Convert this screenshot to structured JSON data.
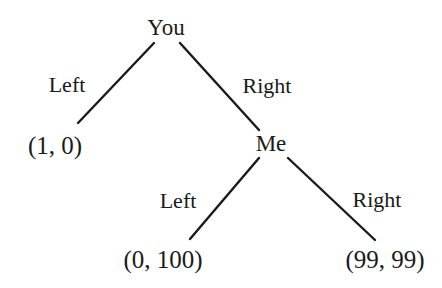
{
  "figure": {
    "type": "game-tree",
    "background_color": "#ffffff",
    "line_color": "#1a1a1a",
    "text_color": "#1a1a1a",
    "width": 442,
    "height": 288
  },
  "nodes": [
    {
      "id": "root",
      "label": "You",
      "kind": "decision-node",
      "player": "You",
      "x": 166,
      "y": 27
    },
    {
      "id": "me",
      "label": "Me",
      "kind": "decision-node",
      "player": "Me",
      "x": 271,
      "y": 143
    }
  ],
  "edge_labels": [
    {
      "id": "you-left",
      "label": "Left",
      "from": "root",
      "to": "payoff-1-0",
      "x": 67,
      "y": 85
    },
    {
      "id": "you-right",
      "label": "Right",
      "from": "root",
      "to": "me",
      "x": 267,
      "y": 86
    },
    {
      "id": "me-left",
      "label": "Left",
      "from": "me",
      "to": "payoff-0-100",
      "x": 178,
      "y": 201
    },
    {
      "id": "me-right",
      "label": "Right",
      "from": "me",
      "to": "payoff-99-99",
      "x": 377,
      "y": 200
    }
  ],
  "payoffs": [
    {
      "id": "payoff-1-0",
      "label": "(1, 0)",
      "values": [
        1,
        0
      ],
      "x": 55,
      "y": 145
    },
    {
      "id": "payoff-0-100",
      "label": "(0, 100)",
      "values": [
        0,
        100
      ],
      "x": 163,
      "y": 259
    },
    {
      "id": "payoff-99-99",
      "label": "(99, 99)",
      "values": [
        99,
        99
      ],
      "x": 385,
      "y": 259
    }
  ],
  "edges": [
    {
      "id": "edge-root-left",
      "from": "root",
      "to": "payoff-1-0",
      "x1": 154,
      "y1": 43,
      "x2": 78,
      "y2": 123
    },
    {
      "id": "edge-root-right",
      "from": "root",
      "to": "me",
      "x1": 180,
      "y1": 43,
      "x2": 259,
      "y2": 130
    },
    {
      "id": "edge-me-left",
      "from": "me",
      "to": "payoff-0-100",
      "x1": 259,
      "y1": 158,
      "x2": 190,
      "y2": 239
    },
    {
      "id": "edge-me-right",
      "from": "me",
      "to": "payoff-99-99",
      "x1": 288,
      "y1": 158,
      "x2": 375,
      "y2": 240
    }
  ]
}
